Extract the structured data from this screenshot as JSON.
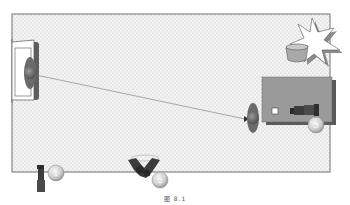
{
  "diagram": {
    "type": "camera-setup-floor-plan",
    "colors": {
      "floor_fill": "#f4f4f4",
      "floor_dots": "#b8b8b8",
      "floor_border": "#6e6e6e",
      "table_fill": "#9a9a9a",
      "table_shadow": "#5a5a5a",
      "camera_dark": "#3c3c3c",
      "badge_fill": "#d8d8d8",
      "badge_text": "#ffffff",
      "plant_fill": "#ffffff",
      "plant_shadow": "#8a8a8a",
      "pot_fill": "#a8a8a8"
    },
    "elements": {
      "sofa": {
        "label": "sofa"
      },
      "person_left": {
        "label": "person-on-sofa"
      },
      "person_right": {
        "label": "person-at-table"
      },
      "sight_line": {
        "label": "eyeline"
      },
      "table": {
        "label": "table"
      },
      "plant": {
        "label": "potted-plant"
      }
    },
    "cameras": [
      {
        "id": "camera-1",
        "badge": "1"
      },
      {
        "id": "camera-2",
        "badge": "2"
      },
      {
        "id": "camera-3",
        "badge": "3"
      }
    ]
  },
  "caption": "图 8.1"
}
